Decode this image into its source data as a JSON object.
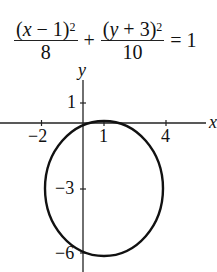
{
  "cut_header": "(c)",
  "equation": {
    "term1_numerator_var": "x",
    "term1_numerator_const": " − 1",
    "term1_exponent": "2",
    "term1_denominator": "8",
    "plus": "+",
    "term2_numerator_var": "y",
    "term2_numerator_const": " + 3",
    "term2_exponent": "2",
    "term2_denominator": "10",
    "equals": "= 1"
  },
  "axes": {
    "x_label": "x",
    "y_label": "y",
    "x_ticks": [
      "−2",
      "1",
      "4"
    ],
    "y_ticks": [
      "1",
      "−3",
      "−6"
    ]
  },
  "ellipse": {
    "center": [
      1,
      -3
    ],
    "a_squared": 8,
    "b_squared": 10,
    "stroke": "#111111"
  }
}
